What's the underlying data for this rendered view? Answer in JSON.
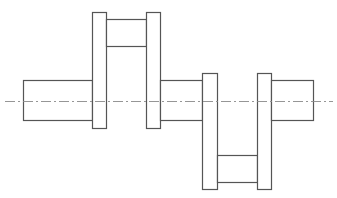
{
  "diagram": {
    "type": "crankshaft-drawing",
    "colors": {
      "outline": "#555555",
      "centerline": "#8a8a8a",
      "background": "#ffffff"
    },
    "centerline": {
      "x1": 5,
      "x2": 333,
      "y": 101
    },
    "parts": [
      {
        "name": "left-shaft",
        "x": 23,
        "y": 80,
        "w": 69,
        "h": 40
      },
      {
        "name": "web-1",
        "x": 92,
        "y": 12,
        "w": 14,
        "h": 116
      },
      {
        "name": "upper-crankpin",
        "x": 106,
        "y": 19,
        "w": 40,
        "h": 27
      },
      {
        "name": "web-2",
        "x": 146,
        "y": 12,
        "w": 14,
        "h": 116
      },
      {
        "name": "middle-shaft",
        "x": 160,
        "y": 80,
        "w": 42,
        "h": 40
      },
      {
        "name": "web-3",
        "x": 202,
        "y": 73,
        "w": 15,
        "h": 116
      },
      {
        "name": "lower-crankpin",
        "x": 217,
        "y": 155,
        "w": 40,
        "h": 27
      },
      {
        "name": "web-4",
        "x": 257,
        "y": 73,
        "w": 14,
        "h": 116
      },
      {
        "name": "right-shaft",
        "x": 271,
        "y": 80,
        "w": 42,
        "h": 40
      }
    ]
  }
}
